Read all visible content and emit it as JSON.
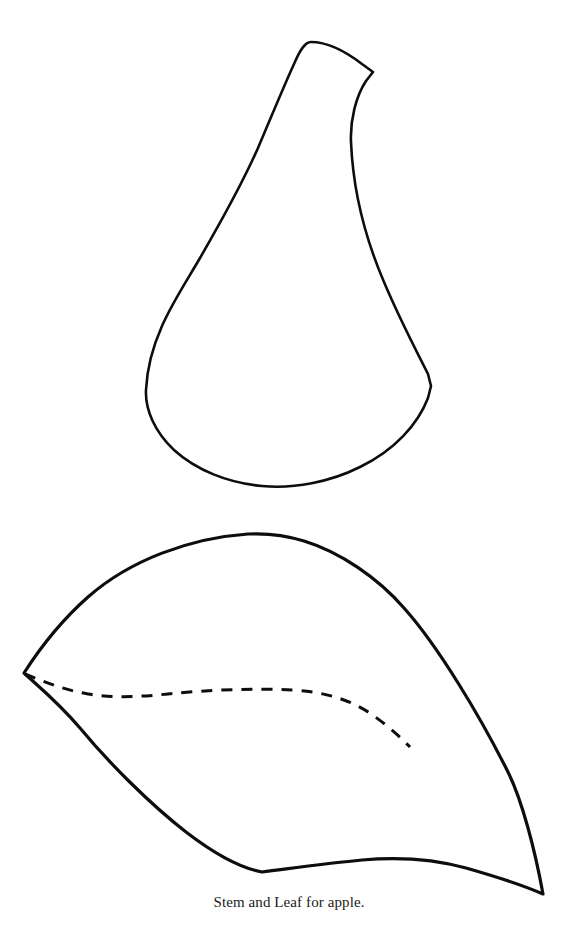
{
  "page": {
    "background_color": "#ffffff",
    "width": 578,
    "height": 942
  },
  "figure": {
    "caption": "Stem and Leaf for apple.",
    "ink_color": "#0d0d0d",
    "shapes": [
      {
        "name": "stem-shape",
        "label": "Stem outline",
        "style": "solid-outline",
        "stroke_width": 2.6
      },
      {
        "name": "leaf-shape",
        "label": "Leaf outline",
        "style": "solid-outline",
        "stroke_width": 3.2
      },
      {
        "name": "leaf-midrib",
        "label": "Leaf midrib vein",
        "style": "dashed-line",
        "stroke_width": 3.0,
        "dash_pattern": "11 9"
      }
    ]
  },
  "paths": {
    "stem_outline": "M 311 42 C 330 42 349 54 362 64 L 373 72 L 366 81 C 356 96 350 120 351 142 C 353 190 366 240 384 282 C 400 320 418 354 428 374 L 431 386 L 428 398 C 418 424 395 450 360 467 C 330 482 294 489 262 486 C 228 483 196 470 174 450 C 155 432 145 410 146 390 C 147 368 154 344 162 326 C 172 303 186 282 200 258 C 222 220 243 182 258 148 C 270 120 283 88 294 64 C 300 50 305 42 311 42 Z",
    "leaf_outline": "M 24 673 C 40 648 62 620 88 597 C 130 560 190 538 248 534 C 268 533 288 536 304 541 C 340 552 378 578 404 608 C 438 646 480 716 508 772 C 522 800 535 850 543 894 C 520 884 494 876 466 868 C 430 858 396 857 362 860 C 330 863 294 868 262 872 C 240 868 212 852 186 832 C 150 804 108 762 80 728 C 58 702 38 686 24 673 Z",
    "leaf_midrib": "M 25 674 C 45 682 64 690 88 694 C 112 698 138 697 168 694 C 206 690 252 688 292 690 C 326 692 352 700 374 716 C 392 729 402 739 410 747"
  },
  "colors": {
    "ink": "#0d0d0d",
    "caption": "#1a1a1a",
    "background": "#ffffff"
  }
}
